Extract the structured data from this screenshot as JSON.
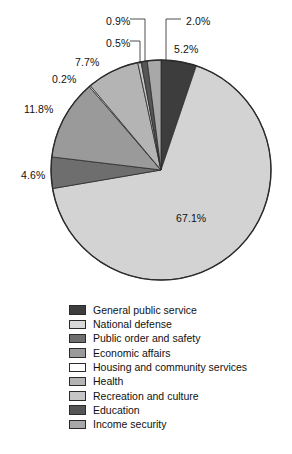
{
  "chart_data": {
    "type": "pie",
    "title": "",
    "legend_position": "below",
    "start_angle_deg": 0,
    "direction": "clockwise",
    "categories": [
      "General public service",
      "National defense",
      "Public order and safety",
      "Economic affairs",
      "Housing and community services",
      "Health",
      "Recreation and culture",
      "Education",
      "Income security"
    ],
    "values": [
      5.2,
      67.1,
      4.6,
      11.8,
      0.2,
      7.7,
      0.5,
      0.9,
      2.0
    ],
    "value_labels": [
      "5.2%",
      "67.1%",
      "4.6%",
      "11.8%",
      "0.2%",
      "7.7%",
      "0.5%",
      "0.9%",
      "2.0%"
    ],
    "colors": [
      "#3d3d3d",
      "#d3d3d3",
      "#6e6e6e",
      "#9a9a9a",
      "#ffffff",
      "#b4b4b4",
      "#c6c6c6",
      "#555555",
      "#a8a8a8"
    ],
    "units": "percent"
  },
  "labels": [
    {
      "text": "0.9%",
      "x": 106,
      "y": 16,
      "name": "pct-label-education"
    },
    {
      "text": "2.0%",
      "x": 186,
      "y": 16,
      "name": "pct-label-income-security"
    },
    {
      "text": "0.5%",
      "x": 106,
      "y": 38,
      "name": "pct-label-recreation-and-culture"
    },
    {
      "text": "5.2%",
      "x": 174,
      "y": 44,
      "name": "pct-label-general-public-service"
    },
    {
      "text": "7.7%",
      "x": 75,
      "y": 57,
      "name": "pct-label-health"
    },
    {
      "text": "0.2%",
      "x": 52,
      "y": 74,
      "name": "pct-label-housing-and-community-services"
    },
    {
      "text": "11.8%",
      "x": 24,
      "y": 104,
      "name": "pct-label-economic-affairs"
    },
    {
      "text": "4.6%",
      "x": 21,
      "y": 170,
      "name": "pct-label-public-order-and-safety"
    },
    {
      "text": "67.1%",
      "x": 176,
      "y": 213,
      "name": "pct-label-national-defense"
    }
  ],
  "legend": {
    "items": [
      {
        "label": "General public service",
        "color": "#3d3d3d"
      },
      {
        "label": "National defense",
        "color": "#d8d8d8"
      },
      {
        "label": "Public order and safety",
        "color": "#6e6e6e"
      },
      {
        "label": "Economic affairs",
        "color": "#9a9a9a"
      },
      {
        "label": "Housing and community services",
        "color": "#ffffff"
      },
      {
        "label": "Health",
        "color": "#b4b4b4"
      },
      {
        "label": "Recreation and culture",
        "color": "#c6c6c6"
      },
      {
        "label": "Education",
        "color": "#555555"
      },
      {
        "label": "Income security",
        "color": "#a8a8a8"
      }
    ]
  },
  "geometry": {
    "cx": 161,
    "cy": 170,
    "r": 110
  },
  "leaders": [
    {
      "name": "leader-education",
      "points": "130,19 145,19 145,62"
    },
    {
      "name": "leader-income-security",
      "points": "181,19 166,19 166,60"
    },
    {
      "name": "leader-recreation-culture",
      "points": "130,41 140,41 140,64"
    }
  ]
}
